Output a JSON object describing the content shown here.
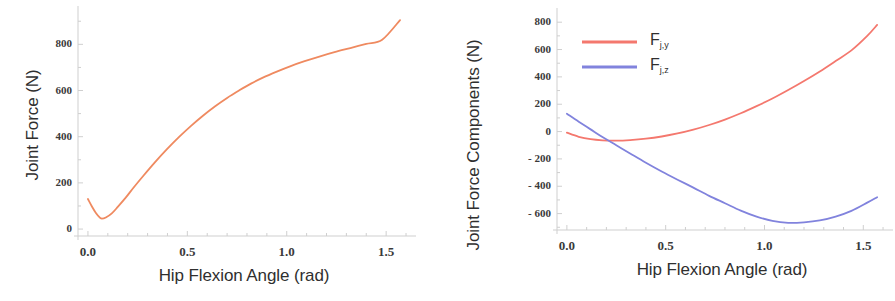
{
  "chart_data": [
    {
      "type": "line",
      "panel": "left",
      "title": "",
      "xlabel": "Hip Flexion Angle (rad)",
      "ylabel": "Joint Force (N)",
      "xlim": [
        -0.05,
        1.62
      ],
      "ylim": [
        -30,
        940
      ],
      "xticks": [
        "0.0",
        "0.5",
        "1.0",
        "1.5"
      ],
      "xtick_values": [
        0.0,
        0.5,
        1.0,
        1.5
      ],
      "yticks": [
        "0",
        "200",
        "400",
        "600",
        "800"
      ],
      "ytick_values": [
        0,
        200,
        400,
        600,
        800
      ],
      "grid": false,
      "legend": "none",
      "series": [
        {
          "name": "Joint Force",
          "color": "#ef8a60",
          "x": [
            0.0,
            0.02,
            0.04,
            0.06,
            0.07,
            0.09,
            0.12,
            0.15,
            0.19,
            0.23,
            0.28,
            0.34,
            0.4,
            0.46,
            0.52,
            0.58,
            0.64,
            0.7,
            0.76,
            0.82,
            0.88,
            0.95,
            1.02,
            1.09,
            1.16,
            1.24,
            1.32,
            1.4,
            1.48,
            1.57
          ],
          "y": [
            130,
            98,
            70,
            50,
            45,
            50,
            68,
            96,
            136,
            180,
            232,
            292,
            348,
            400,
            448,
            492,
            532,
            568,
            600,
            630,
            656,
            682,
            706,
            727,
            746,
            766,
            784,
            802,
            820,
            905
          ]
        }
      ]
    },
    {
      "type": "line",
      "panel": "right",
      "title": "",
      "xlabel": "Hip Flexion Angle (rad)",
      "ylabel": "Joint Force Components (N)",
      "xlim": [
        -0.05,
        1.62
      ],
      "ylim": [
        -720,
        860
      ],
      "xticks": [
        "0.0",
        "0.5",
        "1.0",
        "1.5"
      ],
      "xtick_values": [
        0.0,
        0.5,
        1.0,
        1.5
      ],
      "yticks": [
        "800",
        "600",
        "400",
        "200",
        "0",
        "- 200",
        "- 400",
        "- 600"
      ],
      "ytick_values": [
        800,
        600,
        400,
        200,
        0,
        -200,
        -400,
        -600
      ],
      "grid": false,
      "legend": "inside-top-left",
      "series": [
        {
          "name": "F_j,y",
          "label_main": "F",
          "label_sub": "j,y",
          "color": "#f4786e",
          "x": [
            0.0,
            0.06,
            0.12,
            0.18,
            0.25,
            0.32,
            0.4,
            0.48,
            0.56,
            0.64,
            0.72,
            0.8,
            0.88,
            0.96,
            1.04,
            1.12,
            1.2,
            1.28,
            1.36,
            1.44,
            1.52,
            1.57
          ],
          "y": [
            -8,
            -38,
            -56,
            -64,
            -66,
            -62,
            -52,
            -36,
            -14,
            14,
            48,
            88,
            134,
            186,
            242,
            304,
            370,
            440,
            516,
            594,
            700,
            780
          ]
        },
        {
          "name": "F_j,z",
          "label_main": "F",
          "label_sub": "j,z",
          "color": "#8183dd",
          "x": [
            0.0,
            0.06,
            0.12,
            0.18,
            0.25,
            0.32,
            0.4,
            0.48,
            0.56,
            0.64,
            0.72,
            0.8,
            0.88,
            0.96,
            1.04,
            1.12,
            1.2,
            1.28,
            1.36,
            1.44,
            1.52,
            1.57
          ],
          "y": [
            130,
            72,
            16,
            -40,
            -100,
            -160,
            -228,
            -292,
            -352,
            -410,
            -470,
            -524,
            -578,
            -622,
            -654,
            -668,
            -664,
            -650,
            -622,
            -580,
            -520,
            -480
          ]
        }
      ]
    }
  ],
  "left_panel": {
    "ylabel": "Joint Force (N)",
    "xlabel": "Hip Flexion Angle (rad)",
    "yticks": [
      "800",
      "600",
      "400",
      "200",
      "0"
    ],
    "xticks": [
      "0.0",
      "0.5",
      "1.0",
      "1.5"
    ]
  },
  "right_panel": {
    "ylabel": "Joint Force Components (N)",
    "xlabel": "Hip Flexion Angle (rad)",
    "yticks": [
      "800",
      "600",
      "400",
      "200",
      "0",
      "- 200",
      "- 400",
      "- 600"
    ],
    "xticks": [
      "0.0",
      "0.5",
      "1.0",
      "1.5"
    ],
    "legend": [
      {
        "main": "F",
        "sub": "j,y",
        "color": "#f4786e"
      },
      {
        "main": "F",
        "sub": "j,z",
        "color": "#8183dd"
      }
    ]
  },
  "colors": {
    "axis": "#cfcfcf",
    "text": "#2f2f2f",
    "tick_text": "#3a3a3a",
    "series_orange": "#ef8a60",
    "series_red": "#f4786e",
    "series_blue": "#8183dd",
    "background": "#ffffff"
  }
}
